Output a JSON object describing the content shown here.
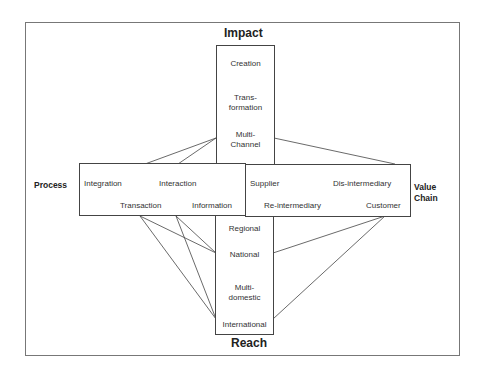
{
  "diagram": {
    "axes": {
      "top": "Impact",
      "bottom": "Reach",
      "left": "Process",
      "right_line1": "Value",
      "right_line2": "Chain"
    },
    "impact_items": [
      {
        "line1": "Creation",
        "line2": ""
      },
      {
        "line1": "Trans-",
        "line2": "formation"
      },
      {
        "line1": "Multi-",
        "line2": "Channel"
      }
    ],
    "reach_items": [
      {
        "line1": "Regional",
        "line2": ""
      },
      {
        "line1": "National",
        "line2": ""
      },
      {
        "line1": "Multi-",
        "line2": "domestic"
      },
      {
        "line1": "International",
        "line2": ""
      }
    ],
    "process_items": [
      "Integration",
      "Interaction",
      "Transaction",
      "Information"
    ],
    "value_chain_items": [
      "Supplier",
      "Dis-intermediary",
      "Re-intermediary",
      "Customer"
    ],
    "connections": [
      {
        "from": "Integration",
        "to": "Multi-Channel"
      },
      {
        "from": "Interaction",
        "to": "Multi-Channel"
      },
      {
        "from": "Multi-Channel",
        "to": "Dis-intermediary"
      },
      {
        "from": "Transaction",
        "to": "National"
      },
      {
        "from": "Transaction",
        "to": "International"
      },
      {
        "from": "Information",
        "to": "National"
      },
      {
        "from": "Information",
        "to": "International"
      },
      {
        "from": "Customer",
        "to": "National"
      },
      {
        "from": "Customer",
        "to": "International"
      }
    ]
  }
}
